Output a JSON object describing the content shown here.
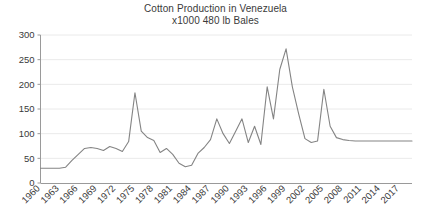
{
  "chart_data": {
    "type": "line",
    "title": "Cotton Production in Venezuela",
    "subtitle": "x1000 480 lb Bales",
    "xlabel": "",
    "ylabel": "",
    "ylim": [
      0,
      300
    ],
    "ytick_values": [
      0,
      50,
      100,
      150,
      200,
      250,
      300
    ],
    "ytick_labels": [
      "0",
      "50",
      "100",
      "150",
      "200",
      "250",
      "300"
    ],
    "grid": true,
    "legend": "none",
    "xlim": [
      1960,
      2019
    ],
    "xtick_labels": [
      "1960",
      "1963",
      "1966",
      "1969",
      "1972",
      "1975",
      "1978",
      "1981",
      "1984",
      "1987",
      "1990",
      "1993",
      "1996",
      "1999",
      "2002",
      "2005",
      "2008",
      "2011",
      "2014",
      "2017"
    ],
    "xtick_values": [
      1960,
      1963,
      1966,
      1969,
      1972,
      1975,
      1978,
      1981,
      1984,
      1987,
      1990,
      1993,
      1996,
      1999,
      2002,
      2005,
      2008,
      2011,
      2014,
      2017
    ],
    "xtick_rotation": 45,
    "series": [
      {
        "name": "Cotton Production",
        "color": "#848484",
        "x": [
          1960,
          1961,
          1962,
          1963,
          1964,
          1965,
          1966,
          1967,
          1968,
          1969,
          1970,
          1971,
          1972,
          1973,
          1974,
          1975,
          1976,
          1977,
          1978,
          1979,
          1980,
          1981,
          1982,
          1983,
          1984,
          1985,
          1986,
          1987,
          1988,
          1989,
          1990,
          1991,
          1992,
          1993,
          1994,
          1995,
          1996,
          1997,
          1998,
          1999,
          2000,
          2001,
          2002,
          2003,
          2004,
          2005,
          2006,
          2007,
          2008,
          2009,
          2010,
          2011,
          2012,
          2013,
          2014,
          2015,
          2016,
          2017,
          2018,
          2019
        ],
        "values": [
          30,
          30,
          30,
          30,
          32,
          46,
          58,
          70,
          72,
          70,
          66,
          74,
          70,
          64,
          84,
          183,
          105,
          92,
          86,
          62,
          70,
          58,
          40,
          33,
          36,
          60,
          72,
          88,
          130,
          100,
          80,
          105,
          130,
          82,
          115,
          78,
          195,
          130,
          230,
          272,
          195,
          140,
          90,
          82,
          85,
          190,
          115,
          92,
          88,
          86,
          85,
          85,
          85,
          85,
          85,
          85,
          85,
          85,
          85,
          85
        ]
      }
    ]
  }
}
